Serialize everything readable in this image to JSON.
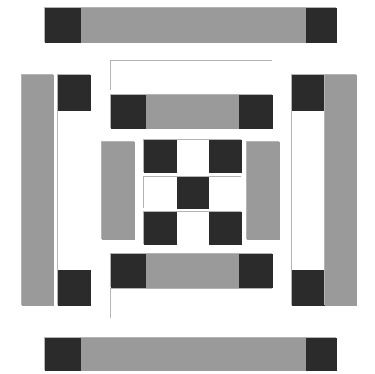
{
  "canvas": {
    "width": 375,
    "height": 374,
    "background": "#ffffff",
    "title": "Abstract Geometric Composition"
  },
  "palette": {
    "gray": "#9a9a9a",
    "dark": "#2b2b2b",
    "white": "#ffffff",
    "outline": "#b4b4b4",
    "background": "#ffffff"
  },
  "shapes": [
    {
      "name": "top-horizontal-bar",
      "kind": "capped-bar",
      "orientation": "horizontal",
      "x": 44,
      "y": 7,
      "w": 292,
      "h": 35,
      "segments": [
        {
          "name": "cap-left",
          "fill": "dark",
          "x": 0,
          "y": 0,
          "w": 36,
          "h": 35
        },
        {
          "name": "body",
          "fill": "gray",
          "x": 36,
          "y": 0,
          "w": 225,
          "h": 35
        },
        {
          "name": "cap-right",
          "fill": "dark",
          "x": 261,
          "y": 0,
          "w": 31,
          "h": 35
        }
      ]
    },
    {
      "name": "bottom-horizontal-bar",
      "kind": "capped-bar",
      "orientation": "horizontal",
      "x": 44,
      "y": 337,
      "w": 292,
      "h": 33,
      "segments": [
        {
          "name": "cap-left",
          "fill": "dark",
          "x": 0,
          "y": 0,
          "w": 36,
          "h": 33
        },
        {
          "name": "body",
          "fill": "gray",
          "x": 36,
          "y": 0,
          "w": 225,
          "h": 33
        },
        {
          "name": "cap-right",
          "fill": "dark",
          "x": 261,
          "y": 0,
          "w": 31,
          "h": 33
        }
      ]
    },
    {
      "name": "left-outer-gray-bar",
      "kind": "solid-bar",
      "orientation": "vertical",
      "x": 21,
      "y": 74,
      "w": 32,
      "h": 231,
      "segments": [
        {
          "name": "body",
          "fill": "gray",
          "x": 0,
          "y": 0,
          "w": 32,
          "h": 231
        }
      ]
    },
    {
      "name": "left-inner-capped-bar",
      "kind": "capped-bar",
      "orientation": "vertical",
      "x": 57,
      "y": 74,
      "w": 33,
      "h": 231,
      "segments": [
        {
          "name": "cap-top",
          "fill": "dark",
          "x": 0,
          "y": 0,
          "w": 33,
          "h": 36
        },
        {
          "name": "body",
          "fill": "white",
          "x": 0,
          "y": 36,
          "w": 33,
          "h": 159
        },
        {
          "name": "cap-bottom",
          "fill": "dark",
          "x": 0,
          "y": 195,
          "w": 33,
          "h": 36
        }
      ]
    },
    {
      "name": "right-inner-capped-bar",
      "kind": "capped-bar",
      "orientation": "vertical",
      "x": 291,
      "y": 74,
      "w": 33,
      "h": 231,
      "segments": [
        {
          "name": "cap-top",
          "fill": "dark",
          "x": 0,
          "y": 0,
          "w": 33,
          "h": 36
        },
        {
          "name": "body",
          "fill": "white",
          "x": 0,
          "y": 36,
          "w": 33,
          "h": 159
        },
        {
          "name": "cap-bottom",
          "fill": "dark",
          "x": 0,
          "y": 195,
          "w": 33,
          "h": 36
        }
      ]
    },
    {
      "name": "right-outer-gray-bar",
      "kind": "solid-bar",
      "orientation": "vertical",
      "x": 324,
      "y": 74,
      "w": 32,
      "h": 231,
      "segments": [
        {
          "name": "body",
          "fill": "gray",
          "x": 0,
          "y": 0,
          "w": 32,
          "h": 231
        }
      ]
    },
    {
      "name": "top-white-panel",
      "kind": "outlined-panel",
      "orientation": "horizontal",
      "x": 110,
      "y": 60,
      "w": 162,
      "h": 30,
      "segments": [
        {
          "name": "body",
          "fill": "white",
          "x": 0,
          "y": 0,
          "w": 162,
          "h": 30
        }
      ]
    },
    {
      "name": "bottom-white-panel",
      "kind": "outlined-panel",
      "orientation": "horizontal",
      "x": 110,
      "y": 288,
      "w": 162,
      "h": 30,
      "segments": [
        {
          "name": "body",
          "fill": "white",
          "x": 0,
          "y": 0,
          "w": 162,
          "h": 30
        }
      ]
    },
    {
      "name": "upper-inner-capped-bar",
      "kind": "capped-bar",
      "orientation": "horizontal",
      "x": 110,
      "y": 94,
      "w": 162,
      "h": 34,
      "segments": [
        {
          "name": "cap-left",
          "fill": "dark",
          "x": 0,
          "y": 0,
          "w": 35,
          "h": 34
        },
        {
          "name": "body",
          "fill": "gray",
          "x": 35,
          "y": 0,
          "w": 93,
          "h": 34
        },
        {
          "name": "cap-right",
          "fill": "dark",
          "x": 128,
          "y": 0,
          "w": 34,
          "h": 34
        }
      ]
    },
    {
      "name": "lower-inner-capped-bar",
      "kind": "capped-bar",
      "orientation": "horizontal",
      "x": 110,
      "y": 253,
      "w": 162,
      "h": 34,
      "segments": [
        {
          "name": "cap-left",
          "fill": "dark",
          "x": 0,
          "y": 0,
          "w": 35,
          "h": 34
        },
        {
          "name": "body",
          "fill": "gray",
          "x": 35,
          "y": 0,
          "w": 93,
          "h": 34
        },
        {
          "name": "cap-right",
          "fill": "dark",
          "x": 128,
          "y": 0,
          "w": 34,
          "h": 34
        }
      ]
    },
    {
      "name": "center-left-gray-bar",
      "kind": "solid-bar",
      "orientation": "vertical",
      "x": 101,
      "y": 141,
      "w": 33,
      "h": 98,
      "segments": [
        {
          "name": "body",
          "fill": "gray",
          "x": 0,
          "y": 0,
          "w": 33,
          "h": 98
        }
      ]
    },
    {
      "name": "center-right-gray-bar",
      "kind": "solid-bar",
      "orientation": "vertical",
      "x": 246,
      "y": 141,
      "w": 33,
      "h": 98,
      "segments": [
        {
          "name": "body",
          "fill": "gray",
          "x": 0,
          "y": 0,
          "w": 33,
          "h": 98
        }
      ]
    },
    {
      "name": "checker-row-top",
      "kind": "checker-row",
      "orientation": "horizontal",
      "x": 143,
      "y": 139,
      "w": 98,
      "h": 33,
      "segments": [
        {
          "name": "cell-1",
          "fill": "dark",
          "x": 0,
          "y": 0,
          "w": 33,
          "h": 33
        },
        {
          "name": "cell-2",
          "fill": "white",
          "x": 33,
          "y": 0,
          "w": 32,
          "h": 33
        },
        {
          "name": "cell-3",
          "fill": "dark",
          "x": 65,
          "y": 0,
          "w": 33,
          "h": 33
        }
      ]
    },
    {
      "name": "checker-row-middle",
      "kind": "checker-row",
      "orientation": "horizontal",
      "x": 143,
      "y": 176,
      "w": 98,
      "h": 32,
      "segments": [
        {
          "name": "cell-1",
          "fill": "white",
          "x": 0,
          "y": 0,
          "w": 33,
          "h": 32
        },
        {
          "name": "cell-2",
          "fill": "dark",
          "x": 33,
          "y": 0,
          "w": 32,
          "h": 32
        },
        {
          "name": "cell-3",
          "fill": "white",
          "x": 65,
          "y": 0,
          "w": 33,
          "h": 32
        }
      ]
    },
    {
      "name": "checker-row-bottom",
      "kind": "checker-row",
      "orientation": "horizontal",
      "x": 143,
      "y": 211,
      "w": 98,
      "h": 33,
      "segments": [
        {
          "name": "cell-1",
          "fill": "dark",
          "x": 0,
          "y": 0,
          "w": 33,
          "h": 33
        },
        {
          "name": "cell-2",
          "fill": "white",
          "x": 33,
          "y": 0,
          "w": 32,
          "h": 33
        },
        {
          "name": "cell-3",
          "fill": "dark",
          "x": 65,
          "y": 0,
          "w": 33,
          "h": 33
        }
      ]
    }
  ]
}
